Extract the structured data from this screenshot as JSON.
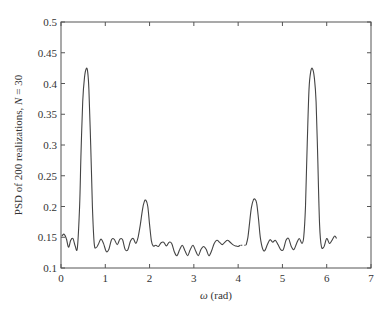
{
  "chart_data": {
    "type": "line",
    "title": "",
    "xlabel": "ω (rad)",
    "xlabel_symbol": "ω",
    "xlabel_unit": "(rad)",
    "ylabel": "PSD of 200 realizations, N = 30",
    "ylabel_prefix": "PSD of 200 realizations, ",
    "ylabel_var": "N",
    "ylabel_suffix": " = 30",
    "xlim": [
      0,
      7
    ],
    "ylim": [
      0.1,
      0.5
    ],
    "xticks": [
      0,
      1,
      2,
      3,
      4,
      5,
      6,
      7
    ],
    "yticks": [
      0.1,
      0.15,
      0.2,
      0.25,
      0.3,
      0.35,
      0.4,
      0.45,
      0.5
    ],
    "ytick_labels": [
      "0.1",
      "0.15",
      "0.2",
      "0.25",
      "0.3",
      "0.35",
      "0.4",
      "0.45",
      "0.5"
    ],
    "grid": false,
    "legend": null,
    "line_color": "#444444",
    "series": [
      {
        "name": "PSD estimate",
        "x": [
          0.02,
          0.07,
          0.12,
          0.17,
          0.22,
          0.27,
          0.32,
          0.37,
          0.42,
          0.45,
          0.49,
          0.53,
          0.57,
          0.6,
          0.63,
          0.67,
          0.71,
          0.75,
          0.79,
          0.84,
          0.9,
          0.96,
          1.02,
          1.08,
          1.14,
          1.2,
          1.27,
          1.33,
          1.39,
          1.45,
          1.51,
          1.57,
          1.63,
          1.69,
          1.74,
          1.79,
          1.84,
          1.88,
          1.92,
          1.96,
          2.0,
          2.04,
          2.08,
          2.14,
          2.2,
          2.26,
          2.32,
          2.38,
          2.44,
          2.5,
          2.56,
          2.62,
          2.68,
          2.74,
          2.8,
          2.86,
          2.92,
          2.98,
          3.04,
          3.1,
          3.16,
          3.22,
          3.28,
          3.34,
          3.4,
          3.46,
          3.52,
          3.58,
          3.64,
          3.7,
          3.76,
          3.82,
          3.88,
          3.94,
          4.0,
          4.05
        ],
        "y": [
          0.152,
          0.155,
          0.148,
          0.134,
          0.145,
          0.148,
          0.136,
          0.133,
          0.2,
          0.28,
          0.37,
          0.41,
          0.424,
          0.42,
          0.39,
          0.3,
          0.2,
          0.14,
          0.133,
          0.138,
          0.147,
          0.14,
          0.127,
          0.13,
          0.146,
          0.147,
          0.138,
          0.147,
          0.146,
          0.13,
          0.13,
          0.144,
          0.148,
          0.14,
          0.15,
          0.17,
          0.195,
          0.208,
          0.21,
          0.2,
          0.17,
          0.145,
          0.136,
          0.137,
          0.135,
          0.141,
          0.142,
          0.136,
          0.142,
          0.14,
          0.126,
          0.12,
          0.13,
          0.137,
          0.128,
          0.12,
          0.13,
          0.137,
          0.128,
          0.12,
          0.13,
          0.135,
          0.13,
          0.12,
          0.128,
          0.14,
          0.145,
          0.142,
          0.138,
          0.142,
          0.145,
          0.142,
          0.138,
          0.136,
          0.135,
          0.137
        ]
      },
      {
        "name": "PSD estimate (continued)",
        "x": [
          4.18,
          4.22,
          4.26,
          4.3,
          4.34,
          4.38,
          4.42,
          4.46,
          4.5,
          4.55,
          4.6,
          4.66,
          4.72,
          4.78,
          4.84,
          4.9,
          4.96,
          5.02,
          5.08,
          5.14,
          5.2,
          5.26,
          5.32,
          5.38,
          5.44,
          5.48,
          5.52,
          5.56,
          5.6,
          5.64,
          5.68,
          5.72,
          5.76,
          5.8,
          5.84,
          5.88,
          5.94,
          6.0,
          6.06,
          6.12,
          6.18,
          6.22
        ],
        "y": [
          0.137,
          0.15,
          0.175,
          0.198,
          0.21,
          0.212,
          0.205,
          0.18,
          0.15,
          0.132,
          0.128,
          0.138,
          0.146,
          0.142,
          0.145,
          0.138,
          0.13,
          0.13,
          0.145,
          0.148,
          0.135,
          0.13,
          0.14,
          0.148,
          0.14,
          0.15,
          0.2,
          0.3,
          0.39,
          0.42,
          0.424,
          0.41,
          0.37,
          0.27,
          0.17,
          0.135,
          0.135,
          0.148,
          0.14,
          0.145,
          0.152,
          0.148
        ]
      }
    ]
  }
}
